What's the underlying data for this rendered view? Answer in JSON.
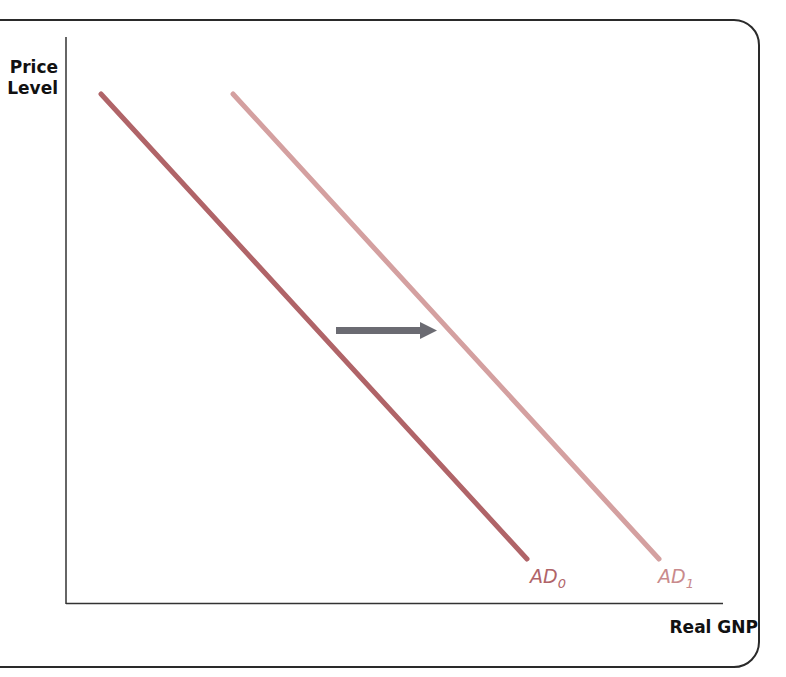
{
  "axes": {
    "y_label_line1": "Price",
    "y_label_line2": "Level",
    "x_label": "Real GNP"
  },
  "curves": [
    {
      "name": "AD",
      "subscript": "0",
      "color": "#b06468"
    },
    {
      "name": "AD",
      "subscript": "1",
      "color": "#d4a0a0"
    }
  ],
  "arrow": {
    "direction": "right",
    "color": "#6b6b72",
    "meaning": "shift of aggregate demand from AD0 to AD1"
  },
  "colors": {
    "frame": "#2a2a2a",
    "axis": "#333333"
  }
}
